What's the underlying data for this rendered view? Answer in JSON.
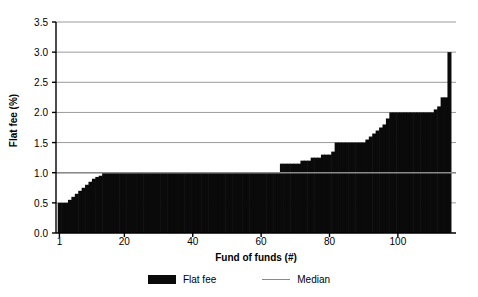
{
  "chart_data": {
    "type": "bar",
    "title": "",
    "xlabel": "Fund of funds (#)",
    "ylabel": "Flat fee (%)",
    "xlim": [
      0,
      117
    ],
    "ylim": [
      0,
      3.5
    ],
    "grid": true,
    "legend_position": "bottom",
    "ytick_labels": [
      "0.0",
      "0.5",
      "1.0",
      "1.5",
      "2.0",
      "2.5",
      "3.0",
      "3.5"
    ],
    "ytick_values": [
      0.0,
      0.5,
      1.0,
      1.5,
      2.0,
      2.5,
      3.0,
      3.5
    ],
    "xtick_labels": [
      "1",
      "20",
      "40",
      "60",
      "80",
      "100"
    ],
    "xtick_values": [
      1,
      20,
      40,
      60,
      80,
      100
    ],
    "series": [
      {
        "name": "Flat fee",
        "kind": "bar",
        "color": "#0a0a0a",
        "x": [
          1,
          2,
          3,
          4,
          5,
          6,
          7,
          8,
          9,
          10,
          11,
          12,
          13,
          14,
          15,
          16,
          17,
          18,
          19,
          20,
          21,
          22,
          23,
          24,
          25,
          26,
          27,
          28,
          29,
          30,
          31,
          32,
          33,
          34,
          35,
          36,
          37,
          38,
          39,
          40,
          41,
          42,
          43,
          44,
          45,
          46,
          47,
          48,
          49,
          50,
          51,
          52,
          53,
          54,
          55,
          56,
          57,
          58,
          59,
          60,
          61,
          62,
          63,
          64,
          65,
          66,
          67,
          68,
          69,
          70,
          71,
          72,
          73,
          74,
          75,
          76,
          77,
          78,
          79,
          80,
          81,
          82,
          83,
          84,
          85,
          86,
          87,
          88,
          89,
          90,
          91,
          92,
          93,
          94,
          95,
          96,
          97,
          98,
          99,
          100,
          101,
          102,
          103,
          104,
          105,
          106,
          107,
          108,
          109,
          110,
          111,
          112,
          113,
          114,
          115
        ],
        "values": [
          0.5,
          0.5,
          0.5,
          0.55,
          0.6,
          0.65,
          0.7,
          0.75,
          0.8,
          0.85,
          0.9,
          0.93,
          0.95,
          1.0,
          1.0,
          1.0,
          1.0,
          1.0,
          1.0,
          1.0,
          1.0,
          1.0,
          1.0,
          1.0,
          1.0,
          1.0,
          1.0,
          1.0,
          1.0,
          1.0,
          1.0,
          1.0,
          1.0,
          1.0,
          1.0,
          1.0,
          1.0,
          1.0,
          1.0,
          1.0,
          1.0,
          1.0,
          1.0,
          1.0,
          1.0,
          1.0,
          1.0,
          1.0,
          1.0,
          1.0,
          1.0,
          1.0,
          1.0,
          1.0,
          1.0,
          1.0,
          1.0,
          1.0,
          1.0,
          1.0,
          1.0,
          1.0,
          1.0,
          1.0,
          1.0,
          1.15,
          1.15,
          1.15,
          1.15,
          1.15,
          1.15,
          1.2,
          1.2,
          1.2,
          1.25,
          1.25,
          1.25,
          1.3,
          1.3,
          1.3,
          1.35,
          1.5,
          1.5,
          1.5,
          1.5,
          1.5,
          1.5,
          1.5,
          1.5,
          1.5,
          1.55,
          1.6,
          1.65,
          1.7,
          1.75,
          1.8,
          1.9,
          2.0,
          2.0,
          2.0,
          2.0,
          2.0,
          2.0,
          2.0,
          2.0,
          2.0,
          2.0,
          2.0,
          2.0,
          2.0,
          2.05,
          2.1,
          2.25,
          2.25,
          3.0
        ]
      },
      {
        "name": "Median",
        "kind": "line",
        "color": "#8a8a8a",
        "value": 1.0
      }
    ],
    "legend": [
      {
        "label": "Flat fee",
        "marker": "bar-swatch",
        "color": "#0a0a0a"
      },
      {
        "label": "Median",
        "marker": "line-swatch",
        "color": "#8a8a8a"
      }
    ]
  }
}
